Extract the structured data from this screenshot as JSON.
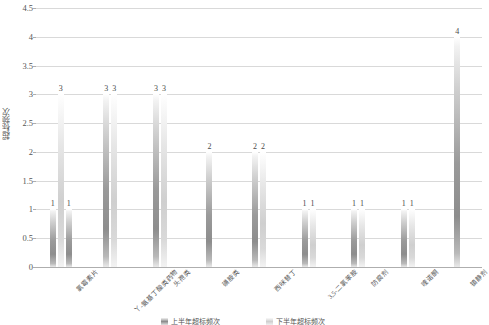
{
  "chart_data": {
    "type": "bar",
    "title": "",
    "xlabel": "",
    "ylabel": "超标频次",
    "ylim": [
      0,
      4.5
    ],
    "ytick_labels": [
      "0",
      "0.5",
      "1",
      "1.5",
      "2",
      "2.5",
      "3",
      "3.5",
      "4",
      "4.5"
    ],
    "ytick_values": [
      0,
      0.5,
      1,
      1.5,
      2,
      2.5,
      3,
      3.5,
      4,
      4.5
    ],
    "grid": true,
    "legend_position": "bottom",
    "categories": [
      "氯霉素片",
      "丫-氨基丁酸类药物",
      "头孢类",
      "磺胺类",
      "西咪替丁",
      "3,5-二氯苯胺",
      "防腐剂",
      "喹诺酮",
      "镇静剂"
    ],
    "series": [
      {
        "name": "上半年超标频次",
        "values": [
          1,
          3,
          3,
          2,
          2,
          1,
          1,
          1,
          4
        ]
      },
      {
        "name": "下半年超标频次",
        "values": [
          1,
          3,
          3,
          null,
          2,
          1,
          1,
          1,
          null
        ]
      }
    ],
    "extra_bars": [
      {
        "category_index": 0,
        "series": 2,
        "value": 3
      }
    ],
    "data_labels": [
      [
        "1",
        "3",
        "1"
      ],
      [
        "3",
        "3"
      ],
      [
        "3",
        "3"
      ],
      [
        "2"
      ],
      [
        "2",
        "2"
      ],
      [
        "1",
        "1"
      ],
      [
        "1",
        "1"
      ],
      [
        "1",
        "1"
      ],
      [
        "4"
      ]
    ],
    "colors": {
      "series1": "#8d8d8d",
      "series2": "#cfcfcf",
      "gridline": "#d9d9d9",
      "axis": "#aeaeae",
      "text": "#555555",
      "background": "#ffffff"
    }
  },
  "legend": {
    "items": [
      {
        "label": "上半年超标频次"
      },
      {
        "label": "下半年超标频次"
      }
    ]
  }
}
